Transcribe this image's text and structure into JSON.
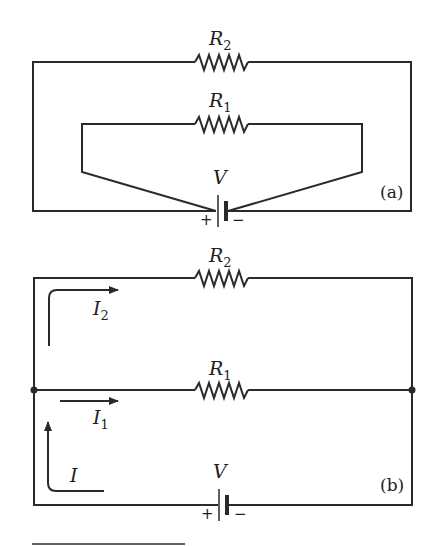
{
  "diagram_a": {
    "panel_label": "(a)",
    "resistor_top": {
      "symbol": "R",
      "subscript": "2"
    },
    "resistor_inner": {
      "symbol": "R",
      "subscript": "1"
    },
    "battery": {
      "symbol": "V",
      "plus": "+",
      "minus": "−"
    }
  },
  "diagram_b": {
    "panel_label": "(b)",
    "resistor_top": {
      "symbol": "R",
      "subscript": "2"
    },
    "resistor_middle": {
      "symbol": "R",
      "subscript": "1"
    },
    "battery": {
      "symbol": "V",
      "plus": "+",
      "minus": "−"
    },
    "currents": [
      {
        "symbol": "I",
        "subscript": "2"
      },
      {
        "symbol": "I",
        "subscript": "1"
      },
      {
        "symbol": "I",
        "subscript": ""
      }
    ]
  },
  "colors": {
    "line": "#2a2a2a",
    "background": "#ffffff"
  }
}
